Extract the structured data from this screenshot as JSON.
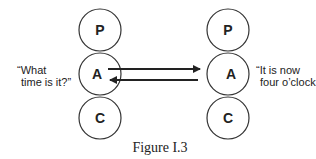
{
  "diagram": {
    "left_person": {
      "circles": [
        {
          "label": "P"
        },
        {
          "label": "A"
        },
        {
          "label": "C"
        }
      ],
      "speech_line1": "“What",
      "speech_line2": "time is it?”"
    },
    "right_person": {
      "circles": [
        {
          "label": "P"
        },
        {
          "label": "A"
        },
        {
          "label": "C"
        }
      ],
      "speech_line1": "“It is now",
      "speech_line2": "four o’clock.”"
    },
    "arrows": [
      {
        "from": "left A",
        "to": "right A",
        "direction": "right"
      },
      {
        "from": "right A",
        "to": "left A",
        "direction": "left"
      }
    ],
    "caption": "Figure I.3"
  }
}
